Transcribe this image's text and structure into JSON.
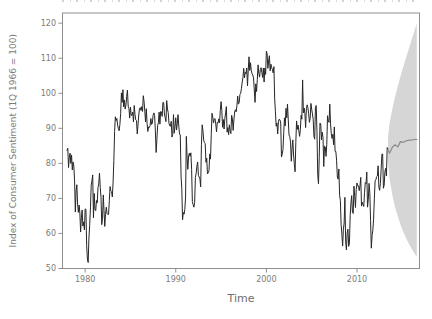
{
  "chart_data": {
    "type": "line",
    "title": "",
    "xlabel": "Time",
    "ylabel": "Index of Consumer Sentiment (1Q 1966 = 100)",
    "xlim": [
      1977.5,
      2016.9
    ],
    "ylim": [
      50.0,
      122.9
    ],
    "grid": false,
    "legend": "none",
    "x_ticks": {
      "values": [
        1980,
        1990,
        2000,
        2010
      ],
      "labels": [
        "1980",
        "1990",
        "2000",
        "2010"
      ]
    },
    "y_ticks": {
      "values": [
        50,
        60,
        70,
        80,
        90,
        100,
        110,
        120
      ],
      "labels": [
        "50",
        "60",
        "70",
        "80",
        "90",
        "100",
        "110",
        "120"
      ]
    },
    "series": [
      {
        "name": "index-of-consumer-sentiment-monthly",
        "type": "line",
        "color": "#262626",
        "width": 1,
        "x_start": 1978.0,
        "x_step": 0.0833333,
        "values": [
          83.7,
          84.3,
          78.8,
          81.6,
          82.9,
          80.0,
          82.4,
          78.1,
          80.4,
          79.3,
          75.0,
          66.1,
          72.1,
          73.9,
          68.4,
          66.0,
          68.1,
          65.8,
          60.4,
          64.5,
          66.7,
          62.1,
          63.3,
          61.0,
          67.0,
          66.9,
          56.5,
          52.7,
          51.7,
          58.7,
          62.3,
          67.3,
          73.7,
          75.0,
          76.7,
          64.5,
          71.4,
          66.9,
          66.5,
          69.4,
          68.7,
          73.1,
          74.1,
          77.2,
          73.1,
          70.3,
          62.5,
          64.3,
          71.0,
          66.5,
          62.0,
          65.5,
          67.5,
          65.7,
          65.4,
          65.4,
          69.3,
          73.4,
          72.1,
          71.9,
          70.4,
          74.6,
          80.8,
          89.1,
          93.3,
          92.2,
          92.8,
          90.9,
          89.9,
          89.3,
          91.1,
          94.2,
          100.1,
          97.4,
          101.0,
          96.1,
          98.1,
          95.5,
          96.6,
          99.1,
          100.9,
          96.3,
          95.7,
          92.9,
          96.0,
          93.7,
          93.7,
          94.6,
          91.8,
          96.5,
          94.0,
          92.4,
          92.2,
          88.4,
          90.9,
          93.8,
          95.6,
          95.9,
          95.1,
          96.2,
          94.8,
          99.3,
          97.7,
          94.9,
          91.8,
          95.6,
          91.4,
          89.1,
          90.4,
          90.2,
          90.8,
          92.8,
          91.1,
          91.5,
          93.7,
          94.4,
          93.6,
          89.3,
          83.1,
          86.8,
          90.8,
          91.6,
          94.6,
          91.2,
          94.8,
          94.7,
          93.4,
          97.4,
          97.3,
          94.1,
          93.0,
          91.9,
          97.9,
          95.5,
          94.5,
          91.5,
          90.7,
          90.6,
          92.0,
          87.5,
          88.3,
          93.9,
          88.6,
          90.5,
          93.0,
          89.5,
          91.3,
          93.9,
          90.6,
          88.3,
          88.2,
          76.4,
          72.8,
          63.9,
          66.0,
          65.5,
          66.8,
          70.4,
          87.7,
          81.8,
          78.3,
          82.1,
          82.9,
          82.0,
          83.0,
          78.3,
          69.1,
          68.2,
          67.5,
          68.8,
          76.0,
          77.2,
          79.2,
          80.4,
          76.6,
          76.1,
          75.6,
          73.3,
          85.3,
          91.0,
          89.3,
          86.6,
          85.9,
          85.6,
          80.3,
          81.5,
          77.0,
          77.3,
          77.9,
          82.7,
          81.2,
          88.2,
          94.3,
          93.2,
          91.5,
          92.6,
          92.8,
          91.2,
          89.0,
          91.7,
          91.5,
          92.7,
          91.6,
          95.1,
          97.6,
          95.1,
          90.3,
          92.5,
          89.8,
          92.7,
          94.4,
          96.2,
          88.9,
          90.2,
          88.2,
          91.0,
          89.3,
          88.5,
          93.7,
          92.7,
          89.4,
          92.4,
          94.7,
          95.3,
          94.7,
          96.5,
          99.2,
          96.9,
          97.4,
          99.7,
          100.0,
          101.4,
          103.2,
          104.5,
          107.1,
          104.4,
          106.0,
          105.6,
          107.2,
          102.1,
          106.6,
          110.4,
          106.5,
          108.7,
          106.5,
          105.6,
          105.2,
          104.4,
          100.9,
          97.4,
          102.7,
          100.5,
          103.9,
          108.1,
          105.7,
          104.6,
          106.8,
          107.3,
          106.0,
          104.5,
          107.2,
          103.2,
          107.2,
          105.4,
          112.0,
          111.3,
          107.1,
          109.2,
          110.7,
          106.4,
          108.3,
          107.3,
          106.8,
          105.8,
          107.6,
          98.4,
          94.7,
          90.6,
          91.5,
          88.4,
          92.0,
          92.6,
          92.4,
          91.5,
          81.8,
          82.7,
          83.9,
          88.8,
          93.0,
          90.7,
          95.7,
          93.0,
          96.9,
          92.4,
          88.1,
          87.6,
          86.1,
          80.6,
          84.2,
          86.7,
          82.4,
          79.9,
          77.6,
          86.0,
          92.1,
          89.7,
          90.9,
          89.3,
          87.7,
          89.6,
          93.7,
          92.6,
          103.8,
          94.4,
          95.8,
          94.2,
          90.2,
          95.6,
          96.7,
          95.9,
          94.2,
          91.7,
          92.8,
          97.1,
          95.5,
          94.1,
          92.6,
          87.7,
          86.9,
          96.0,
          96.5,
          89.1,
          76.9,
          74.2,
          81.6,
          91.5,
          91.2,
          86.7,
          88.9,
          87.4,
          79.1,
          84.9,
          84.7,
          82.0,
          85.4,
          93.6,
          92.1,
          91.7,
          96.9,
          91.3,
          88.4,
          87.1,
          88.3,
          85.3,
          90.4,
          83.4,
          83.4,
          80.9,
          76.1,
          75.5,
          78.4,
          70.8,
          69.5,
          62.6,
          59.8,
          56.4,
          61.2,
          63.0,
          70.3,
          57.6,
          55.3,
          60.1,
          61.2,
          56.3,
          57.3,
          65.1,
          68.7,
          70.8,
          66.0,
          65.7,
          73.5,
          70.6,
          67.4,
          72.5,
          74.4,
          73.6,
          73.6,
          72.2,
          73.6,
          76.0,
          67.8,
          68.9,
          68.2,
          67.7,
          71.6,
          74.5,
          74.2,
          77.5,
          67.5,
          69.8,
          74.3,
          71.5,
          63.7,
          55.8,
          59.4,
          60.9,
          64.1,
          69.9,
          75.0,
          75.3,
          76.2,
          76.4,
          79.3,
          73.2,
          72.3,
          74.3,
          78.3,
          82.6,
          82.7,
          72.9,
          73.8,
          77.6,
          78.6,
          76.4,
          84.5,
          84.1
        ]
      },
      {
        "name": "forecast-mean",
        "type": "line",
        "color": "#8a8a8a",
        "width": 1.2,
        "x": [
          2013.42,
          2013.6,
          2013.9,
          2014.2,
          2014.5,
          2014.8,
          2015.1,
          2015.4,
          2015.7,
          2016.0,
          2016.3,
          2016.6
        ],
        "y": [
          83.8,
          82.9,
          84.6,
          85.3,
          84.7,
          86.2,
          86.0,
          86.4,
          86.6,
          86.6,
          86.8,
          86.8
        ]
      }
    ],
    "bands": [
      {
        "name": "forecast-prediction-interval",
        "color": "#d6d6d6",
        "x": [
          2013.42,
          2013.6,
          2013.9,
          2014.2,
          2014.5,
          2014.8,
          2015.1,
          2015.4,
          2015.7,
          2016.0,
          2016.3,
          2016.6
        ],
        "lower": [
          80.5,
          75.5,
          71.0,
          67.5,
          65.0,
          62.5,
          60.5,
          58.8,
          57.2,
          55.8,
          54.5,
          53.3
        ],
        "upper": [
          87.5,
          91.5,
          95.5,
          99.0,
          102.0,
          104.8,
          107.5,
          110.0,
          112.5,
          115.0,
          117.5,
          120.0
        ]
      }
    ],
    "colors": {
      "background": "#ffffff",
      "axis": "#8f8f8f",
      "tick_text": "#7b7b7b",
      "observed_line": "#262626",
      "forecast_line": "#8a8a8a",
      "interval_fill": "#d6d6d6"
    }
  }
}
